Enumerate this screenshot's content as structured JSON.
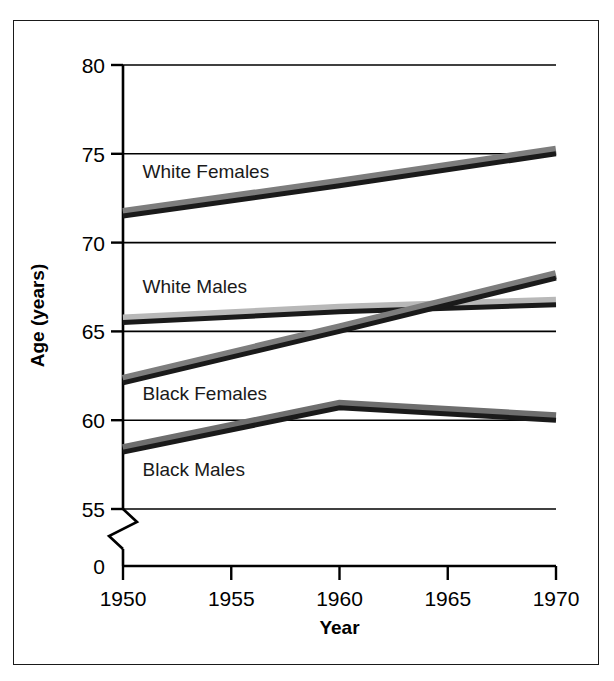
{
  "chart_data": {
    "type": "line",
    "title": "",
    "xlabel": "Year",
    "ylabel": "Age (years)",
    "x": [
      1950,
      1960,
      1970
    ],
    "xlim": [
      1950,
      1970
    ],
    "ylim": [
      55,
      80
    ],
    "y_axis_break": true,
    "y_break_label": "0",
    "xticks": [
      "1950",
      "1955",
      "1960",
      "1965",
      "1970"
    ],
    "xtick_values": [
      1950,
      1955,
      1960,
      1965,
      1970
    ],
    "yticks": [
      "0",
      "55",
      "60",
      "65",
      "70",
      "75",
      "80"
    ],
    "ytick_values": [
      55,
      60,
      65,
      70,
      75,
      80
    ],
    "grid": true,
    "legend_position": "inline-labels",
    "series": [
      {
        "name": "White Females",
        "label": "White Females",
        "x": [
          1950,
          1960,
          1970
        ],
        "values": [
          71.5,
          73.2,
          75.0
        ],
        "color": "#1a1a1a",
        "shadow_color": "#7d7d7d"
      },
      {
        "name": "White Males",
        "label": "White Males",
        "x": [
          1950,
          1960,
          1970
        ],
        "values": [
          65.5,
          66.1,
          66.5
        ],
        "color": "#1a1a1a",
        "shadow_color": "#b8b8b8"
      },
      {
        "name": "Black Females",
        "label": "Black Females",
        "x": [
          1950,
          1960,
          1970
        ],
        "values": [
          62.1,
          65.0,
          68.0
        ],
        "color": "#1a1a1a",
        "shadow_color": "#7d7d7d"
      },
      {
        "name": "Black Males",
        "label": "Black Males",
        "x": [
          1950,
          1960,
          1970
        ],
        "values": [
          58.2,
          60.7,
          60.0
        ],
        "color": "#1a1a1a",
        "shadow_color": "#6e6e6e"
      }
    ],
    "annotations": [
      {
        "text": "White Females",
        "x": 1950.9,
        "y": 74.05
      },
      {
        "text": "White Males",
        "x": 1950.9,
        "y": 67.55
      },
      {
        "text": "Black Females",
        "x": 1950.9,
        "y": 61.55
      },
      {
        "text": "Black Males",
        "x": 1950.9,
        "y": 57.25
      }
    ]
  }
}
